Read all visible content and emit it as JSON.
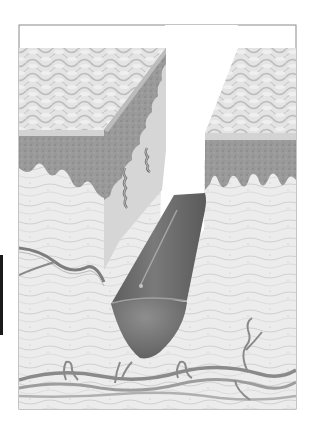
{
  "figure": {
    "palette": {
      "background": "#ffffff",
      "frame_border": "#8a8a8a",
      "surface_light": "#e6e6e6",
      "surface_scale": "#c4c4c4",
      "stratum_band": "#d2d2d2",
      "epidermis_dark": "#8c8c8c",
      "epidermis_mid": "#a8a8a8",
      "dermis": "#ebebeb",
      "dermis_line": "#c8c8c8",
      "cut_face": "#d9d9d9",
      "implant_body": "#6e6e6e",
      "implant_tip": "#7d7d7d",
      "implant_highlight": "#b5b5b5",
      "vessel": "#8f8f8f",
      "vessel_light": "#bdbdbd",
      "side_tab": "#1a1a1a"
    },
    "parts": [
      "left-skin-block",
      "right-skin-block",
      "incision-gap",
      "cylindrical-implant",
      "nerve-fibers",
      "blood-vessel-network",
      "side-tab"
    ]
  }
}
